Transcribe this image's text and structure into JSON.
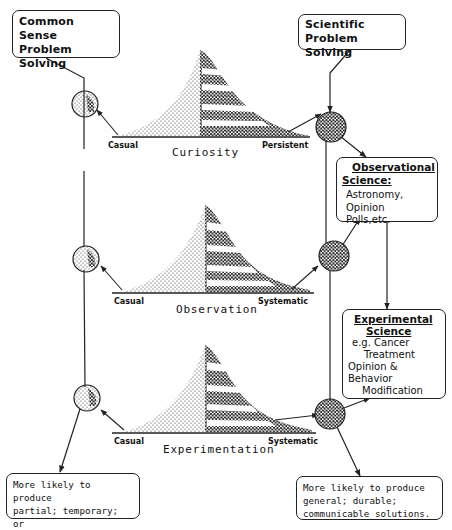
{
  "boxes": {
    "common_sense": {
      "line1": "Common Sense",
      "line2": "Problem Solving"
    },
    "scientific": {
      "line1": "Scientific",
      "line2": "Problem Solving"
    },
    "observational": {
      "heading1": "Observational",
      "heading2": "Science:",
      "line1": "Astronomy,",
      "line2": "Opinion Polls,etc."
    },
    "experimental": {
      "heading1": "Experimental",
      "heading2": "Science",
      "line1": "e.g. Cancer",
      "line2": "Treatment",
      "line3": "Opinion & Behavior",
      "line4": "Modification"
    },
    "outcome_left": {
      "line1": "More likely to produce",
      "line2": "partial; temporary; or",
      "line3": "pseudo-solutions"
    },
    "outcome_right": {
      "line1": "More likely to produce",
      "line2": "general; durable;",
      "line3": "communicable solutions."
    }
  },
  "scales": [
    {
      "title": "Curiosity",
      "left": "Casual",
      "right": "Persistent"
    },
    {
      "title": "Observation",
      "left": "Casual",
      "right": "Systematic"
    },
    {
      "title": "Experimentation",
      "left": "Casual",
      "right": "Systematic"
    }
  ],
  "colors": {
    "ink": "#222222",
    "background": "#ffffff"
  }
}
